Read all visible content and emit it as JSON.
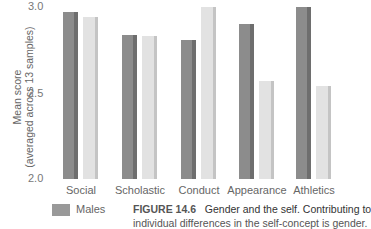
{
  "chart_data": {
    "type": "bar",
    "title": "",
    "xlabel": "",
    "ylabel": "Mean score (averaged across 13 samples)",
    "ylim": [
      2.0,
      3.0
    ],
    "yticks": [
      "3.0",
      "2.5",
      "2.0"
    ],
    "categories": [
      "Social",
      "Scholastic",
      "Conduct",
      "Appearance",
      "Athletics"
    ],
    "series": [
      {
        "name": "Males",
        "color": "#8c8c8c",
        "values": [
          2.97,
          2.84,
          2.81,
          2.9,
          3.0
        ]
      },
      {
        "name": "Females",
        "color": "#e2e2e2",
        "values": [
          2.94,
          2.83,
          3.0,
          2.57,
          2.54
        ]
      }
    ],
    "grid": false,
    "legend_position": "bottom-left"
  },
  "axis": {
    "ylabel_line1": "Mean score",
    "ylabel_line2": "(averaged across 13 samples)",
    "tick_top": "3.0",
    "tick_mid": "2.5",
    "tick_bottom": "2.0"
  },
  "legend": {
    "males_label": "Males"
  },
  "caption": {
    "label": "FIGURE 14.6",
    "text": "Gender and the self. Contributing to",
    "text_line2": "individual differences in the self-concept is gender."
  }
}
